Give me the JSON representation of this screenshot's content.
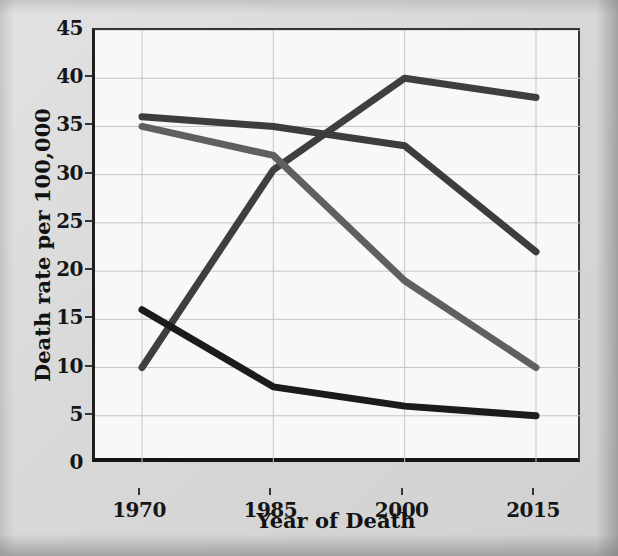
{
  "chart_data": {
    "type": "line",
    "title": "",
    "xlabel": "Year of Death",
    "ylabel": "Death rate per 100,000",
    "x": [
      1970,
      1985,
      2000,
      2015
    ],
    "xticklabels": [
      "1970",
      "1985",
      "2000",
      "2015"
    ],
    "yticks": [
      0,
      5,
      10,
      15,
      20,
      25,
      30,
      35,
      40,
      45
    ],
    "yticklabels": [
      "0",
      "5",
      "10",
      "15",
      "20",
      "25",
      "30",
      "35",
      "40",
      "45"
    ],
    "ylim": [
      0,
      45
    ],
    "xlim": [
      1970,
      2015
    ],
    "grid": true,
    "legend": "none",
    "series": [
      {
        "name": "rising-series",
        "color": "#3c3c3c",
        "values": [
          10,
          30.5,
          40,
          38
        ]
      },
      {
        "name": "high-declining-series",
        "color": "#3a3a3a",
        "values": [
          36,
          35,
          33,
          22
        ]
      },
      {
        "name": "gray-declining-series",
        "color": "#5e5e5e",
        "values": [
          35,
          32,
          19,
          10
        ]
      },
      {
        "name": "low-declining-series",
        "color": "#171717",
        "values": [
          16,
          8,
          6,
          5
        ]
      }
    ]
  },
  "axes": {
    "y_title": "Death rate per 100,000",
    "x_title": "Year of Death",
    "y_tick_labels": [
      "45",
      "40",
      "35",
      "30",
      "25",
      "20",
      "15",
      "10",
      "5",
      "0"
    ],
    "x_tick_labels": [
      "1970",
      "1985",
      "2000",
      "2015"
    ]
  },
  "style": {
    "background": "#dcdcdc",
    "plot_background": "#fdfdfd",
    "grid_color": "#c8c8c8",
    "axis_color": "#111111"
  }
}
